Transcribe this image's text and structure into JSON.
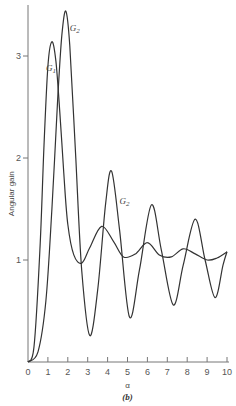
{
  "chart_data": {
    "type": "line",
    "title": "",
    "caption": "(b)",
    "xlabel": "α",
    "ylabel": "Angular gain",
    "xlim": [
      0,
      10
    ],
    "ylim": [
      0,
      3.5
    ],
    "xticks": [
      "0",
      "1",
      "2",
      "3",
      "4",
      "5",
      "6",
      "7",
      "8",
      "9",
      "10"
    ],
    "yticks": [
      "1",
      "2",
      "3"
    ],
    "grid": false,
    "legend": "inline labels",
    "series": [
      {
        "name": "G1",
        "label_pos": {
          "x": 0.9,
          "y": 2.85
        },
        "x": [
          0,
          0.3,
          0.6,
          0.8,
          1.0,
          1.2,
          1.4,
          1.6,
          1.8,
          2.0,
          2.3,
          2.7,
          3.1,
          3.7,
          4.3,
          4.8,
          5.4,
          6.0,
          6.6,
          7.2,
          7.8,
          8.4,
          9.0,
          9.5,
          10.0
        ],
        "values": [
          0,
          0.15,
          1.1,
          2.1,
          2.9,
          3.14,
          2.95,
          2.45,
          1.85,
          1.35,
          1.05,
          0.97,
          1.12,
          1.33,
          1.18,
          1.03,
          1.06,
          1.17,
          1.05,
          1.03,
          1.11,
          1.06,
          1.0,
          1.02,
          1.08
        ]
      },
      {
        "name": "G2",
        "label_pos": {
          "x": 2.1,
          "y": 3.25
        },
        "label2_pos": {
          "x": 4.6,
          "y": 1.55
        },
        "x": [
          0,
          0.5,
          0.9,
          1.2,
          1.5,
          1.7,
          1.9,
          2.1,
          2.4,
          2.7,
          3.1,
          3.5,
          3.9,
          4.2,
          4.6,
          5.1,
          5.6,
          6.2,
          6.7,
          7.3,
          7.8,
          8.4,
          8.9,
          9.4,
          9.8,
          10.0
        ],
        "values": [
          0,
          0.1,
          0.6,
          1.5,
          2.6,
          3.2,
          3.44,
          3.1,
          2.0,
          0.9,
          0.26,
          0.7,
          1.55,
          1.87,
          1.3,
          0.44,
          0.9,
          1.54,
          1.1,
          0.56,
          0.95,
          1.4,
          1.0,
          0.63,
          0.95,
          1.08
        ]
      }
    ]
  }
}
